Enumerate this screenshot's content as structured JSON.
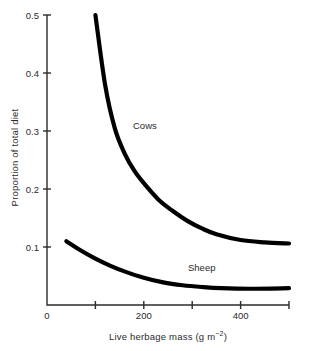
{
  "chart_data": {
    "type": "line",
    "title": "",
    "xlabel": "Live herbage mass (g m−2)",
    "xlabel_main": "Live herbage mass (g m",
    "xlabel_sup": "−2",
    "xlabel_tail": ")",
    "ylabel": "Proportion of total diet",
    "xlim": [
      0,
      500
    ],
    "ylim": [
      0,
      0.5
    ],
    "grid": false,
    "legend": "inline-curve-labels",
    "x_ticks_major": [
      0,
      200,
      400
    ],
    "x_tick_labels": [
      "0",
      "200",
      "400"
    ],
    "x_ticks_minor": [
      100,
      300,
      500
    ],
    "y_ticks_major": [
      0.1,
      0.2,
      0.3,
      0.4,
      0.5
    ],
    "y_tick_labels": [
      "0.1",
      "0.2",
      "0.3",
      "0.4",
      "0.5"
    ],
    "series": [
      {
        "name": "Cows",
        "color": "#000000",
        "x": [
          100,
          120,
          140,
          160,
          180,
          200,
          230,
          260,
          290,
          320,
          350,
          400,
          450,
          500
        ],
        "values": [
          0.5,
          0.38,
          0.305,
          0.262,
          0.232,
          0.21,
          0.182,
          0.162,
          0.145,
          0.132,
          0.122,
          0.112,
          0.108,
          0.106
        ]
      },
      {
        "name": "Sheep",
        "color": "#000000",
        "x": [
          40,
          70,
          100,
          130,
          160,
          200,
          240,
          280,
          320,
          360,
          420,
          500
        ],
        "values": [
          0.11,
          0.094,
          0.08,
          0.068,
          0.058,
          0.047,
          0.039,
          0.034,
          0.031,
          0.029,
          0.028,
          0.029
        ]
      }
    ]
  },
  "axes": {
    "y_title": "Proportion of total diet",
    "x_title_main": "Live herbage mass (g m",
    "x_title_sup": "−2",
    "x_title_tail": ")",
    "y_labels": [
      "0.5",
      "0.4",
      "0.3",
      "0.2",
      "0.1"
    ],
    "x_labels": [
      "0",
      "200",
      "400"
    ],
    "axis_color": "#2b2b2b"
  },
  "series_labels": {
    "cows": "Cows",
    "sheep": "Sheep"
  }
}
